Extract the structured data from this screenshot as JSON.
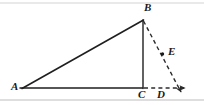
{
  "figure": {
    "kind": "geometry-diagram",
    "canvas": {
      "width": 204,
      "height": 105
    },
    "colors": {
      "background": "#ffffff",
      "stroke": "#1f1f1f",
      "dashed_stroke": "#2b2b2b",
      "frame_rule": "#cfcfcf",
      "label_text": "#1a1a1a"
    },
    "points": [
      {
        "id": "A",
        "label": "A",
        "x": 22,
        "y": 88,
        "label_x": 11,
        "label_y": 81,
        "marker": false
      },
      {
        "id": "B",
        "label": "B",
        "x": 143,
        "y": 20,
        "label_x": 144,
        "label_y": 3,
        "marker": false
      },
      {
        "id": "C",
        "label": "C",
        "x": 143,
        "y": 87,
        "label_x": 138,
        "label_y": 90,
        "marker": false
      },
      {
        "id": "D",
        "label": "D",
        "x": 162,
        "y": 87,
        "label_x": 157,
        "label_y": 90,
        "marker": false
      },
      {
        "id": "E",
        "label": "E",
        "x": 162,
        "y": 54,
        "label_x": 168,
        "label_y": 46,
        "marker": true
      }
    ],
    "segments": [
      {
        "id": "AB",
        "from": "A",
        "to": "B",
        "style": "solid",
        "x1": 22,
        "y1": 88,
        "x2": 143,
        "y2": 20
      },
      {
        "id": "AC",
        "from": "A",
        "to": "C",
        "style": "solid",
        "x1": 20,
        "y1": 88,
        "x2": 143,
        "y2": 88
      },
      {
        "id": "BC",
        "from": "B",
        "to": "C",
        "style": "solid",
        "x1": 143,
        "y1": 20,
        "x2": 143,
        "y2": 88
      }
    ],
    "rays": [
      {
        "id": "BD-ray",
        "from": "B",
        "through": "E",
        "to": "D",
        "style": "dashed",
        "arrow": true,
        "x1": 143,
        "y1": 21,
        "x2": 183,
        "y2": 96
      },
      {
        "id": "CD-ray",
        "from": "C",
        "through": "D",
        "style": "dashed",
        "arrow": true,
        "x1": 143,
        "y1": 88,
        "x2": 188,
        "y2": 88
      }
    ],
    "dash_pattern": "4 3",
    "stroke_width": 1.3,
    "frame_rules": [
      {
        "id": "top-rule",
        "x1": 0,
        "y1": 3,
        "x2": 204,
        "y2": 3
      },
      {
        "id": "bottom-rule",
        "x1": 0,
        "y1": 100,
        "x2": 204,
        "y2": 100
      }
    ]
  }
}
